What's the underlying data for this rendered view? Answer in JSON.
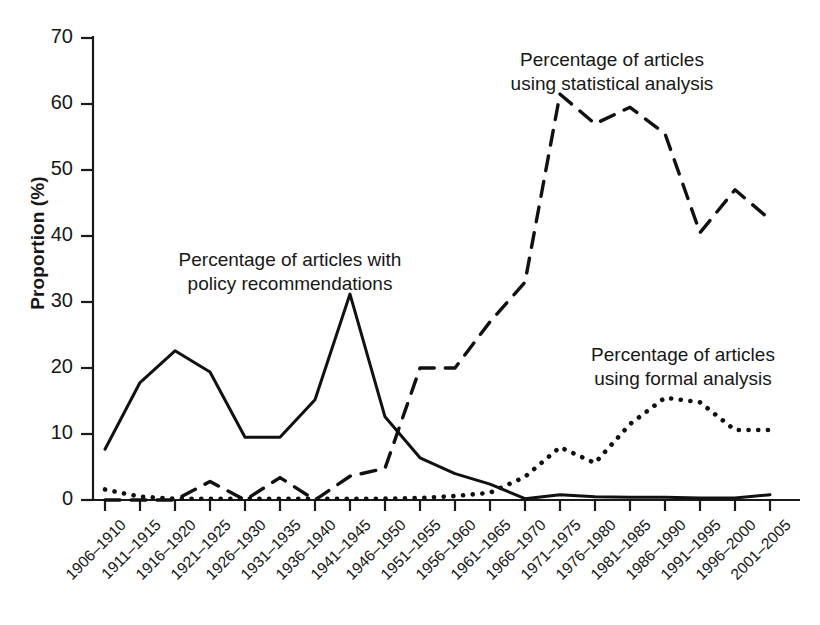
{
  "chart_data": {
    "type": "line",
    "title": "",
    "xlabel": "",
    "ylabel": "Proportion (%)",
    "ylim": [
      0,
      70
    ],
    "yticks": [
      0,
      10,
      20,
      30,
      40,
      50,
      60,
      70
    ],
    "grid": false,
    "legend_position": "inline-annotations",
    "categories": [
      "1906–1910",
      "1911–1915",
      "1916–1920",
      "1921–1925",
      "1926–1930",
      "1931–1935",
      "1936–1940",
      "1941–1945",
      "1946–1950",
      "1951–1955",
      "1956–1960",
      "1961–1965",
      "1966–1970",
      "1971–1975",
      "1976–1980",
      "1981–1985",
      "1986–1990",
      "1991–1995",
      "1996–2000",
      "2001–2005"
    ],
    "series": [
      {
        "name": "Percentage of articles with policy recommendations",
        "style": "solid",
        "color": "#111111",
        "values": [
          7.7,
          17.8,
          22.6,
          19.4,
          9.5,
          9.5,
          15.2,
          31.2,
          12.6,
          6.4,
          4.0,
          2.4,
          0.2,
          0.8,
          0.5,
          0.4,
          0.4,
          0.3,
          0.3,
          0.8
        ]
      },
      {
        "name": "Percentage of articles using statistical analysis",
        "style": "dashed",
        "color": "#111111",
        "values": [
          0.0,
          0.0,
          0.0,
          2.8,
          0.0,
          3.4,
          0.0,
          3.6,
          4.8,
          20.0,
          20.0,
          27.0,
          33.0,
          61.5,
          57.0,
          59.5,
          55.5,
          40.5,
          47.0,
          42.5
        ]
      },
      {
        "name": "Percentage of articles using formal analysis",
        "style": "dotted",
        "color": "#111111",
        "values": [
          1.6,
          0.5,
          0.2,
          0.2,
          0.2,
          0.2,
          0.2,
          0.2,
          0.2,
          0.3,
          0.6,
          1.1,
          3.5,
          8.0,
          5.6,
          11.5,
          15.5,
          14.8,
          10.6,
          10.6
        ]
      }
    ],
    "annotations": [
      {
        "name": "policy-recommendations-label",
        "lines": [
          "Percentage of articles with",
          "policy recommendations"
        ],
        "x": 290,
        "y": 248
      },
      {
        "name": "statistical-analysis-label",
        "lines": [
          "Percentage of articles",
          "using statistical analysis"
        ],
        "x": 612,
        "y": 48
      },
      {
        "name": "formal-analysis-label",
        "lines": [
          "Percentage of articles",
          "using formal analysis"
        ],
        "x": 683,
        "y": 343
      }
    ]
  },
  "axes": {
    "y_label": "Proportion (%)",
    "y_tick_labels": [
      "70",
      "60",
      "50",
      "40",
      "30",
      "20",
      "10",
      "0"
    ],
    "x_tick_labels": [
      "1906–1910",
      "1911–1915",
      "1916–1920",
      "1921–1925",
      "1926–1930",
      "1931–1935",
      "1936–1940",
      "1941–1945",
      "1946–1950",
      "1951–1955",
      "1956–1960",
      "1961–1965",
      "1966–1970",
      "1971–1975",
      "1976–1980",
      "1981–1985",
      "1986–1990",
      "1991–1995",
      "1996–2000",
      "2001–2005"
    ]
  },
  "style": {
    "axis_color": "#1a1a1a",
    "line_color": "#111111",
    "background": "#ffffff"
  }
}
